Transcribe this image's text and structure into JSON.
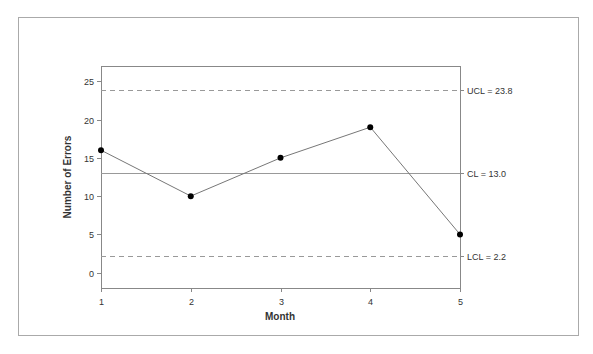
{
  "chart_data": {
    "type": "line",
    "subtype": "control-chart",
    "title": "",
    "xlabel": "Month",
    "ylabel": "Number of Errors",
    "categories": [
      "1",
      "2",
      "3",
      "4",
      "5"
    ],
    "x": [
      1,
      2,
      3,
      4,
      5
    ],
    "series": [
      {
        "name": "Number of Errors",
        "values": [
          16,
          10,
          15,
          19,
          5
        ]
      }
    ],
    "control_limits": [
      {
        "name": "UCL",
        "value": 23.8,
        "label": "UCL = 23.8",
        "style": "dashed"
      },
      {
        "name": "CL",
        "value": 13.0,
        "label": "CL = 13.0",
        "style": "solid"
      },
      {
        "name": "LCL",
        "value": 2.2,
        "label": "LCL = 2.2",
        "style": "dashed"
      }
    ],
    "yticks": [
      0,
      5,
      10,
      15,
      20,
      25
    ],
    "ylim": [
      -2,
      27
    ],
    "xlim": [
      1,
      5
    ],
    "grid": false,
    "legend": "none"
  },
  "colors": {
    "frame": "#aaaaaa",
    "axis": "#888888",
    "line": "#777777",
    "limit_line": "#999999",
    "marker": "#000000",
    "text": "#333333"
  }
}
